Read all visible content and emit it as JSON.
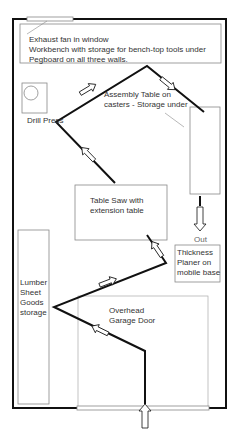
{
  "diagram": {
    "type": "workshop-floor-plan",
    "colors": {
      "wall": "#111111",
      "outline": "#888888",
      "text": "#333333",
      "background": "#ffffff"
    },
    "labels": {
      "workbench_line1": "Exhaust fan in window",
      "workbench_line2": "Workbench with storage for bench-top tools under",
      "workbench_line3": "Pegboard on all three walls.",
      "drill_press": "Drill Press",
      "assembly_line1": "Assembly Table on",
      "assembly_line2": "casters - Storage under",
      "table_saw_line1": "Table Saw with",
      "table_saw_line2": "extension table",
      "out": "Out",
      "planer_line1": "Thickness",
      "planer_line2": "Planer on",
      "planer_line3": "mobile base",
      "lumber_line1": "Lumber",
      "lumber_line2": "Sheet",
      "lumber_line3": "Goods",
      "lumber_line4": "storage",
      "garage_line1": "Overhead",
      "garage_line2": "Garage Door"
    },
    "nodes": [
      {
        "id": "entrance",
        "label": "Overhead Garage Door"
      },
      {
        "id": "lumber",
        "label": "Lumber Sheet Goods storage"
      },
      {
        "id": "planer",
        "label": "Thickness Planer on mobile base"
      },
      {
        "id": "table-saw",
        "label": "Table Saw with extension table"
      },
      {
        "id": "drill-press",
        "label": "Drill Press"
      },
      {
        "id": "assembly",
        "label": "Assembly Table on casters - Storage under"
      },
      {
        "id": "exit",
        "label": "Out"
      }
    ],
    "workflow": [
      "entrance",
      "lumber",
      "planer",
      "table-saw",
      "drill-press",
      "assembly",
      "exit"
    ]
  }
}
